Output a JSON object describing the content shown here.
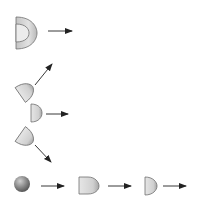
{
  "diagram": {
    "colors": {
      "background": "#ffffff",
      "shape_fill_light": "#e8e8e8",
      "shape_fill_dark": "#a8a8a8",
      "shape_stroke": "#707070",
      "arrow": "#222222"
    },
    "nodes": [
      {
        "id": "hollow-dome",
        "shape": "half-shell",
        "x": 16,
        "y": 17,
        "w": 20,
        "h": 32
      },
      {
        "id": "tilted-dome-up",
        "shape": "half-disk-rotated",
        "x": 18,
        "y": 82
      },
      {
        "id": "half-disk-mid",
        "shape": "half-disk",
        "x": 31,
        "y": 104
      },
      {
        "id": "tilted-dome-down",
        "shape": "half-disk-rotated",
        "x": 18,
        "y": 128
      },
      {
        "id": "sphere",
        "shape": "sphere",
        "cx": 22,
        "cy": 184,
        "r": 8
      },
      {
        "id": "bullet",
        "shape": "bullet",
        "x": 79,
        "y": 177
      },
      {
        "id": "half-disk-end",
        "shape": "half-disk",
        "x": 145,
        "y": 177
      }
    ],
    "arrows": [
      {
        "id": "arrow-1",
        "x1": 48,
        "y1": 31,
        "x2": 72,
        "y2": 31
      },
      {
        "id": "arrow-2",
        "x1": 35,
        "y1": 85,
        "x2": 52,
        "y2": 64
      },
      {
        "id": "arrow-3",
        "x1": 46,
        "y1": 114,
        "x2": 68,
        "y2": 114
      },
      {
        "id": "arrow-4",
        "x1": 35,
        "y1": 145,
        "x2": 51,
        "y2": 162
      },
      {
        "id": "arrow-5",
        "x1": 41,
        "y1": 186,
        "x2": 64,
        "y2": 186
      },
      {
        "id": "arrow-6",
        "x1": 108,
        "y1": 186,
        "x2": 131,
        "y2": 186
      },
      {
        "id": "arrow-7",
        "x1": 163,
        "y1": 186,
        "x2": 186,
        "y2": 186
      }
    ]
  }
}
